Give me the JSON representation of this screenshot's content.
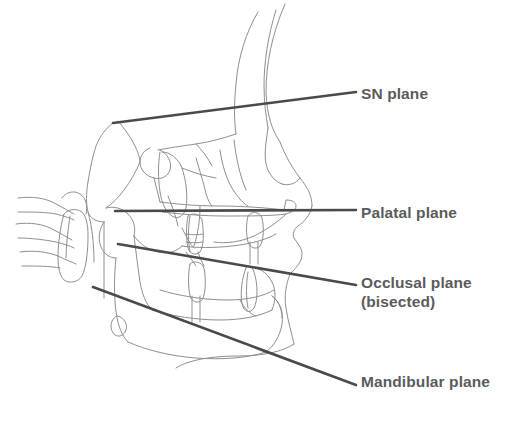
{
  "figure": {
    "kind": "cephalometric-tracing",
    "background_color": "#ffffff",
    "tracing_color": "#8e8e94",
    "plane_line_color": "#4a4a4a",
    "label_color": "#5b5b5b"
  },
  "labels": {
    "sn": "SN plane",
    "palatal": "Palatal plane",
    "occlusal_line1": "Occlusal plane",
    "occlusal_line2": "(bisected)",
    "mandibular": "Mandibular plane"
  },
  "planes": [
    {
      "name": "SN plane",
      "x1": 113,
      "y1": 123,
      "x2": 356,
      "y2": 92
    },
    {
      "name": "Palatal plane",
      "x1": 115,
      "y1": 211,
      "x2": 356,
      "y2": 210
    },
    {
      "name": "Occlusal plane (bisected)",
      "x1": 118,
      "y1": 244,
      "x2": 356,
      "y2": 285
    },
    {
      "name": "Mandibular plane",
      "x1": 93,
      "y1": 287,
      "x2": 356,
      "y2": 385
    }
  ]
}
